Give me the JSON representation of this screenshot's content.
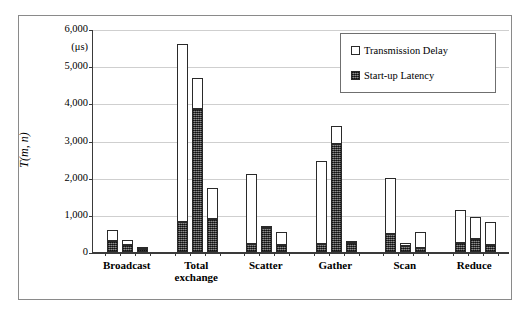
{
  "figure": {
    "unit_label": "(μs)",
    "y_axis_title": "T(m, n)"
  },
  "legend": {
    "position": "top-right",
    "entries": [
      {
        "label": "Transmission Delay",
        "swatch": "white-open-square",
        "color": "#ffffff"
      },
      {
        "label": "Start-up Latency",
        "swatch": "hatched-square",
        "color": "#4a4a4a"
      }
    ]
  },
  "chart_data": {
    "type": "bar",
    "subtype": "grouped-stacked",
    "title": "",
    "xlabel": "",
    "ylabel": "T(m, n)",
    "yunit": "(μs)",
    "ylim": [
      0,
      6000
    ],
    "ytick_labels": [
      "0",
      "1,000",
      "2,000",
      "3,000",
      "4,000",
      "5,000",
      "6,000"
    ],
    "ytick_values": [
      0,
      1000,
      2000,
      3000,
      4000,
      5000,
      6000
    ],
    "grid": "horizontal",
    "legend_position": "upper right",
    "categories": [
      "Broadcast",
      "Total exchange",
      "Scatter",
      "Gather",
      "Scan",
      "Reduce"
    ],
    "bars_per_category": 3,
    "series": [
      {
        "name": "Start-up Latency",
        "values": [
          [
            300,
            180,
            90
          ],
          [
            800,
            3850,
            880
          ],
          [
            220,
            640,
            180
          ],
          [
            220,
            2900,
            230
          ],
          [
            480,
            150,
            120
          ],
          [
            230,
            350,
            180
          ]
        ]
      },
      {
        "name": "Transmission Delay",
        "values": [
          [
            300,
            140,
            50
          ],
          [
            4800,
            830,
            840
          ],
          [
            1880,
            50,
            360
          ],
          [
            2230,
            480,
            20
          ],
          [
            1520,
            80,
            420
          ],
          [
            900,
            580,
            640
          ]
        ]
      }
    ],
    "totals": [
      [
        600,
        320,
        140
      ],
      [
        5600,
        4680,
        1720
      ],
      [
        2100,
        690,
        540
      ],
      [
        2450,
        3380,
        250
      ],
      [
        2000,
        230,
        540
      ],
      [
        1130,
        930,
        820
      ]
    ]
  }
}
